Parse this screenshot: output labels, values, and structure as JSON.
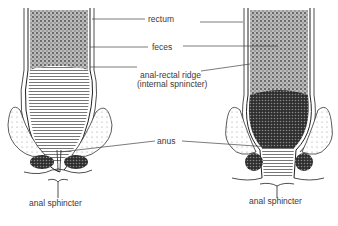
{
  "diagram": {
    "labels": {
      "rectum": "rectum",
      "feces": "feces",
      "ridge_line1": "anal-rectal ridge",
      "ridge_line2": "(internal spnincter)",
      "anus": "anus",
      "sphincter_left": "anal sphincter",
      "sphincter_right": "anal sphincter"
    },
    "panels": [
      {
        "id": "left",
        "state": "relaxed-closed"
      },
      {
        "id": "right",
        "state": "open"
      }
    ]
  }
}
